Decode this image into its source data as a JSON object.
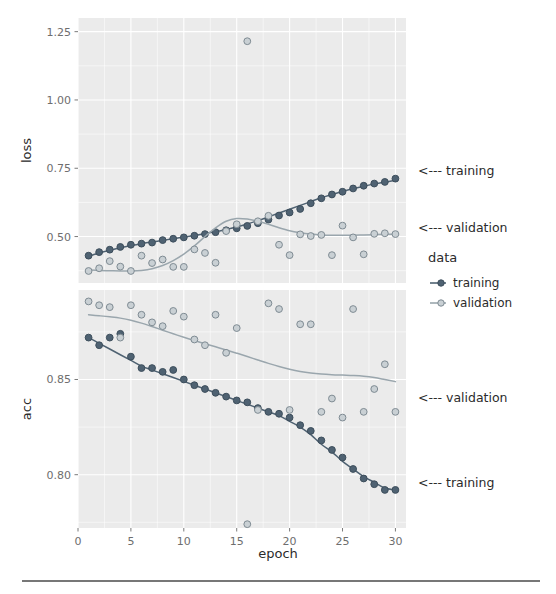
{
  "figure": {
    "bottom_rule": true
  },
  "axes": {
    "x_title": "epoch",
    "x_ticks": [
      "0",
      "5",
      "10",
      "15",
      "20",
      "25",
      "30"
    ],
    "loss_y_title": "loss",
    "loss_y_ticks": [
      "0.50",
      "0.75",
      "1.00",
      "1.25"
    ],
    "acc_y_title": "acc",
    "acc_y_ticks": [
      "0.80",
      "0.85"
    ]
  },
  "legend": {
    "title": "data",
    "items": [
      {
        "label": "training",
        "color": "#4f6272"
      },
      {
        "label": "validation",
        "color": "#9aa6ad"
      }
    ]
  },
  "annotations": {
    "loss_training": "<--- training",
    "loss_validation": "<--- validation",
    "acc_validation": "<--- validation",
    "acc_training": "<--- training"
  },
  "colors": {
    "training": "#4f6272",
    "validation": "#9aa6ad",
    "panel": "#ebebeb",
    "grid": "#ffffff",
    "text": "#2b2b2b",
    "axis_text": "#6e6e6e"
  },
  "chart_data": {
    "type": "scatter",
    "title": "",
    "xlabel": "epoch",
    "facets": [
      {
        "name": "loss",
        "ylabel": "loss",
        "ylim": [
          0.33,
          1.3
        ],
        "yticks": [
          0.5,
          0.75,
          1.0,
          1.25
        ],
        "xlim": [
          0,
          31
        ],
        "xticks": [
          0,
          5,
          10,
          15,
          20,
          25,
          30
        ],
        "grid": true,
        "series": [
          {
            "name": "training",
            "color": "#4f6272",
            "x": [
              1,
              2,
              3,
              4,
              5,
              6,
              7,
              8,
              9,
              10,
              11,
              12,
              13,
              14,
              15,
              16,
              17,
              18,
              19,
              20,
              21,
              22,
              23,
              24,
              25,
              26,
              27,
              28,
              29,
              30
            ],
            "y": [
              0.43,
              0.443,
              0.452,
              0.462,
              0.47,
              0.474,
              0.478,
              0.487,
              0.492,
              0.497,
              0.503,
              0.509,
              0.516,
              0.523,
              0.53,
              0.539,
              0.549,
              0.562,
              0.577,
              0.588,
              0.601,
              0.622,
              0.64,
              0.654,
              0.664,
              0.676,
              0.686,
              0.694,
              0.7,
              0.712
            ],
            "smooth_y": [
              0.428,
              0.44,
              0.45,
              0.459,
              0.467,
              0.474,
              0.48,
              0.486,
              0.492,
              0.498,
              0.504,
              0.511,
              0.518,
              0.526,
              0.535,
              0.546,
              0.558,
              0.572,
              0.586,
              0.6,
              0.614,
              0.628,
              0.642,
              0.654,
              0.665,
              0.675,
              0.684,
              0.692,
              0.699,
              0.706
            ]
          },
          {
            "name": "validation",
            "color": "#9aa6ad",
            "x": [
              1,
              2,
              3,
              4,
              5,
              6,
              7,
              8,
              9,
              10,
              11,
              12,
              13,
              14,
              15,
              16,
              17,
              18,
              19,
              20,
              21,
              22,
              23,
              24,
              25,
              26,
              27,
              28,
              29,
              30
            ],
            "y": [
              0.374,
              0.384,
              0.41,
              0.39,
              0.374,
              0.43,
              0.403,
              0.416,
              0.389,
              0.389,
              0.453,
              0.44,
              0.404,
              0.52,
              0.545,
              1.215,
              0.556,
              0.576,
              0.47,
              0.432,
              0.508,
              0.502,
              0.506,
              0.432,
              0.54,
              0.497,
              0.435,
              0.51,
              0.512,
              0.509
            ],
            "smooth_y": [
              0.378,
              0.376,
              0.375,
              0.374,
              0.374,
              0.376,
              0.382,
              0.394,
              0.412,
              0.436,
              0.466,
              0.5,
              0.532,
              0.556,
              0.566,
              0.564,
              0.556,
              0.545,
              0.532,
              0.521,
              0.514,
              0.509,
              0.506,
              0.505,
              0.505,
              0.505,
              0.506,
              0.507,
              0.508,
              0.508
            ]
          }
        ]
      },
      {
        "name": "acc",
        "ylabel": "acc",
        "ylim": [
          0.772,
          0.897
        ],
        "yticks": [
          0.8,
          0.85
        ],
        "xlim": [
          0,
          31
        ],
        "xticks": [
          0,
          5,
          10,
          15,
          20,
          25,
          30
        ],
        "grid": true,
        "series": [
          {
            "name": "training",
            "color": "#4f6272",
            "x": [
              1,
              2,
              3,
              4,
              5,
              6,
              7,
              8,
              9,
              10,
              11,
              12,
              13,
              14,
              15,
              16,
              17,
              18,
              19,
              20,
              21,
              22,
              23,
              24,
              25,
              26,
              27,
              28,
              29,
              30
            ],
            "y": [
              0.872,
              0.868,
              0.872,
              0.874,
              0.862,
              0.856,
              0.856,
              0.854,
              0.855,
              0.85,
              0.847,
              0.845,
              0.843,
              0.841,
              0.839,
              0.838,
              0.835,
              0.833,
              0.832,
              0.83,
              0.826,
              0.823,
              0.818,
              0.813,
              0.809,
              0.803,
              0.798,
              0.795,
              0.792,
              0.792
            ],
            "smooth_y": [
              0.872,
              0.869,
              0.866,
              0.863,
              0.86,
              0.857,
              0.855,
              0.853,
              0.851,
              0.849,
              0.847,
              0.845,
              0.843,
              0.841,
              0.839,
              0.837,
              0.835,
              0.833,
              0.831,
              0.828,
              0.825,
              0.821,
              0.816,
              0.812,
              0.807,
              0.803,
              0.799,
              0.796,
              0.793,
              0.792
            ]
          },
          {
            "name": "validation",
            "color": "#9aa6ad",
            "x": [
              1,
              2,
              3,
              4,
              5,
              6,
              7,
              8,
              9,
              10,
              11,
              12,
              13,
              14,
              15,
              16,
              17,
              18,
              19,
              20,
              21,
              22,
              23,
              24,
              25,
              26,
              27,
              28,
              29,
              30
            ],
            "y": [
              0.891,
              0.889,
              0.888,
              0.872,
              0.889,
              0.884,
              0.88,
              0.878,
              0.886,
              0.883,
              0.871,
              0.868,
              0.884,
              0.864,
              0.877,
              0.774,
              0.834,
              0.89,
              0.887,
              0.834,
              0.879,
              0.879,
              0.833,
              0.84,
              0.83,
              0.887,
              0.833,
              0.845,
              0.858,
              0.833
            ]
          }
        ]
      }
    ]
  }
}
